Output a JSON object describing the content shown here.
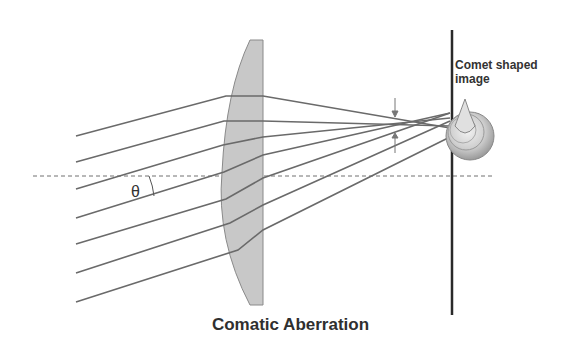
{
  "diagram": {
    "title": "Comatic Aberration",
    "labels": {
      "comet_line1": "Comet shaped",
      "comet_line2": "image",
      "angle": "θ"
    },
    "elements": [
      "optical-axis (dashed)",
      "lens (plano-convex, gray)",
      "image screen (vertical line)",
      "7 incident oblique rays",
      "convergence arrows",
      "comet-shaped blur spot"
    ],
    "colors": {
      "rays": "#6a6a6a",
      "lens_fill": "#c8c8c8",
      "screen": "#2a2a2a",
      "text": "#333333"
    }
  }
}
